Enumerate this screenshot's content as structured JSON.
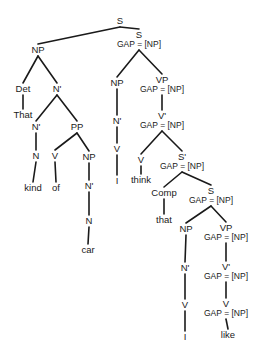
{
  "diagram": {
    "type": "syntax-tree",
    "colors": {
      "ink": "#1a1a1a",
      "background": "#ffffff"
    },
    "gap_label": "GAP = [NP]",
    "nodes": [
      {
        "id": "s_root",
        "label": "S",
        "x": 120,
        "y": 21
      },
      {
        "id": "np_subj",
        "label": "NP",
        "x": 38,
        "y": 50
      },
      {
        "id": "s_gap",
        "label": "S",
        "gap": "GAP = [NP]",
        "x": 139,
        "y": 35
      },
      {
        "id": "det",
        "label": "Det",
        "x": 23,
        "y": 89
      },
      {
        "id": "nbar_1",
        "label": "N'",
        "x": 57,
        "y": 89
      },
      {
        "id": "that_det",
        "label": "That",
        "x": 23,
        "y": 115,
        "leaf": true
      },
      {
        "id": "nbar_2",
        "label": "N'",
        "x": 36,
        "y": 127
      },
      {
        "id": "pp",
        "label": "PP",
        "x": 77,
        "y": 127
      },
      {
        "id": "n_kind",
        "label": "N",
        "x": 36,
        "y": 156
      },
      {
        "id": "v_of",
        "label": "V",
        "x": 55,
        "y": 156
      },
      {
        "id": "np_car",
        "label": "NP",
        "x": 89,
        "y": 157
      },
      {
        "id": "kind",
        "label": "kind",
        "x": 33,
        "y": 188,
        "leaf": true
      },
      {
        "id": "of",
        "label": "of",
        "x": 56,
        "y": 188,
        "leaf": true
      },
      {
        "id": "nbar_car",
        "label": "N'",
        "x": 89,
        "y": 186
      },
      {
        "id": "n_car",
        "label": "N",
        "x": 89,
        "y": 221
      },
      {
        "id": "car",
        "label": "car",
        "x": 88,
        "y": 250,
        "leaf": true
      },
      {
        "id": "np_mid",
        "label": "NP",
        "x": 117,
        "y": 83
      },
      {
        "id": "vp_gap",
        "label": "VP",
        "gap": "GAP = [NP]",
        "x": 162,
        "y": 80
      },
      {
        "id": "nbar_mid",
        "label": "N'",
        "x": 117,
        "y": 121
      },
      {
        "id": "vbar_gap",
        "label": "V'",
        "gap": "GAP = [NP]",
        "x": 162,
        "y": 116
      },
      {
        "id": "v_mid",
        "label": "V",
        "x": 117,
        "y": 149
      },
      {
        "id": "i_mid",
        "label": "I",
        "x": 117,
        "y": 181,
        "leaf": true
      },
      {
        "id": "v_think",
        "label": "V",
        "x": 141,
        "y": 160
      },
      {
        "id": "think",
        "label": "think",
        "x": 141,
        "y": 180,
        "leaf": true
      },
      {
        "id": "sbar_gap",
        "label": "S'",
        "gap": "GAP = [NP]",
        "x": 182,
        "y": 157
      },
      {
        "id": "comp",
        "label": "Comp",
        "x": 164,
        "y": 193
      },
      {
        "id": "that_comp",
        "label": "that",
        "x": 164,
        "y": 220,
        "leaf": true
      },
      {
        "id": "s_low_gap",
        "label": "S",
        "gap": "GAP = [NP]",
        "x": 211,
        "y": 191
      },
      {
        "id": "np_low",
        "label": "NP",
        "x": 186,
        "y": 229
      },
      {
        "id": "vp_low_gap",
        "label": "VP",
        "gap": "GAP = [NP]",
        "x": 226,
        "y": 228
      },
      {
        "id": "nbar_low",
        "label": "N'",
        "x": 185,
        "y": 268
      },
      {
        "id": "vbar_low_gap",
        "label": "V'",
        "gap": "GAP = [NP]",
        "x": 226,
        "y": 267
      },
      {
        "id": "v_low",
        "label": "V",
        "x": 185,
        "y": 305
      },
      {
        "id": "v_like_gap",
        "label": "V",
        "gap": "GAP = [NP]",
        "x": 226,
        "y": 304
      },
      {
        "id": "i_low",
        "label": "I",
        "x": 185,
        "y": 337,
        "leaf": true
      },
      {
        "id": "like",
        "label": "like",
        "x": 228,
        "y": 335,
        "leaf": true
      }
    ],
    "edges": [
      [
        "s_root",
        "np_subj"
      ],
      [
        "s_root",
        "s_gap"
      ],
      [
        "np_subj",
        "det"
      ],
      [
        "np_subj",
        "nbar_1"
      ],
      [
        "det",
        "that_det"
      ],
      [
        "nbar_1",
        "nbar_2"
      ],
      [
        "nbar_1",
        "pp"
      ],
      [
        "nbar_2",
        "n_kind"
      ],
      [
        "n_kind",
        "kind"
      ],
      [
        "pp",
        "v_of"
      ],
      [
        "pp",
        "np_car"
      ],
      [
        "v_of",
        "of"
      ],
      [
        "np_car",
        "nbar_car"
      ],
      [
        "nbar_car",
        "n_car"
      ],
      [
        "n_car",
        "car"
      ],
      [
        "s_gap",
        "np_mid"
      ],
      [
        "s_gap",
        "vp_gap"
      ],
      [
        "np_mid",
        "nbar_mid"
      ],
      [
        "nbar_mid",
        "v_mid"
      ],
      [
        "v_mid",
        "i_mid"
      ],
      [
        "vp_gap",
        "vbar_gap"
      ],
      [
        "vbar_gap",
        "v_think"
      ],
      [
        "vbar_gap",
        "sbar_gap"
      ],
      [
        "v_think",
        "think"
      ],
      [
        "sbar_gap",
        "comp"
      ],
      [
        "sbar_gap",
        "s_low_gap"
      ],
      [
        "comp",
        "that_comp"
      ],
      [
        "s_low_gap",
        "np_low"
      ],
      [
        "s_low_gap",
        "vp_low_gap"
      ],
      [
        "np_low",
        "nbar_low"
      ],
      [
        "nbar_low",
        "v_low"
      ],
      [
        "v_low",
        "i_low"
      ],
      [
        "vp_low_gap",
        "vbar_low_gap"
      ],
      [
        "vbar_low_gap",
        "v_like_gap"
      ],
      [
        "v_like_gap",
        "like"
      ]
    ]
  }
}
